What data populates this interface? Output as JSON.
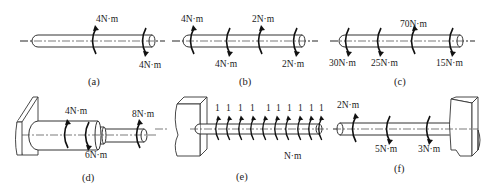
{
  "figure": {
    "panels": [
      {
        "id": "a",
        "caption": "(a)",
        "torques": [
          {
            "label": "4N·m",
            "position": "top"
          },
          {
            "label": "4N·m",
            "position": "bottom"
          }
        ]
      },
      {
        "id": "b",
        "caption": "(b)",
        "torques": [
          {
            "label": "4N·m",
            "position": "top"
          },
          {
            "label": "4N·m",
            "position": "bottom"
          },
          {
            "label": "2N·m",
            "position": "top"
          },
          {
            "label": "2N·m",
            "position": "bottom"
          }
        ]
      },
      {
        "id": "c",
        "caption": "(c)",
        "torques": [
          {
            "label": "30N·m",
            "position": "bottom"
          },
          {
            "label": "25N·m",
            "position": "bottom"
          },
          {
            "label": "70N·m",
            "position": "top"
          },
          {
            "label": "15N·m",
            "position": "bottom"
          }
        ]
      },
      {
        "id": "d",
        "caption": "(d)",
        "torques": [
          {
            "label": "4N·m",
            "position": "top"
          },
          {
            "label": "6N·m",
            "position": "bottom"
          },
          {
            "label": "8N·m",
            "position": "top"
          }
        ]
      },
      {
        "id": "e",
        "caption": "(e)",
        "distributed_values": [
          "1",
          "1",
          "1",
          "1",
          "1",
          "1",
          "1",
          "1",
          "1",
          "1"
        ],
        "unit_label": "N·m"
      },
      {
        "id": "f",
        "caption": "(f)",
        "torques": [
          {
            "label": "2N·m",
            "position": "top"
          },
          {
            "label": "5N·m",
            "position": "bottom"
          },
          {
            "label": "3N·m",
            "position": "bottom"
          }
        ]
      }
    ]
  }
}
